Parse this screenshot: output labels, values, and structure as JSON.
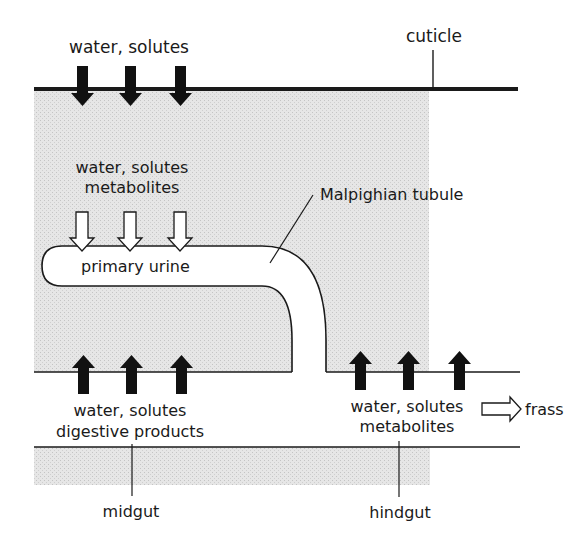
{
  "diagram": {
    "type": "insect excretory system schematic",
    "labels": {
      "cuticle": "cuticle",
      "top_inputs": "water, solutes",
      "tubule_inputs_line1": "water, solutes",
      "tubule_inputs_line2": "metabolites",
      "malpighian_tubule": "Malpighian tubule",
      "primary_urine": "primary urine",
      "midgut_outputs_line1": "water, solutes",
      "midgut_outputs_line2": "digestive products",
      "hindgut_outputs_line1": "water, solutes",
      "hindgut_outputs_line2": "metabolites",
      "frass": "frass",
      "midgut": "midgut",
      "hindgut": "hindgut"
    },
    "arrows": {
      "cuticle_inward": {
        "count": 3,
        "style": "solid-black",
        "direction": "down"
      },
      "into_tubule": {
        "count": 3,
        "style": "hollow-white",
        "direction": "down"
      },
      "midgut_resorption": {
        "count": 3,
        "style": "solid-black",
        "direction": "up"
      },
      "hindgut_resorption": {
        "count": 3,
        "style": "solid-black",
        "direction": "up"
      },
      "frass_out": {
        "count": 1,
        "style": "hollow-white",
        "direction": "right"
      }
    },
    "colors": {
      "hemolymph_fill": "#e4e4e4",
      "line": "#1a1a1a",
      "arrow_solid": "#111111",
      "background": "#ffffff"
    }
  }
}
